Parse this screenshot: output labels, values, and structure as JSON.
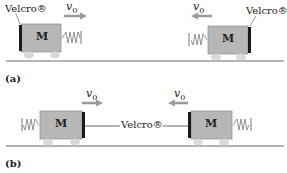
{
  "panel_a": {
    "label": "(a)",
    "left_cart": {
      "mass_label": "M",
      "velcro_label": "Velcro®",
      "velocity_label": "v",
      "velocity_sub": "0",
      "direction": "right"
    },
    "right_cart": {
      "mass_label": "M",
      "velcro_label": "Velcro®",
      "velocity_label": "v",
      "velocity_sub": "0",
      "direction": "left"
    }
  },
  "panel_b": {
    "label": "(b)",
    "left_cart": {
      "mass_label": "M",
      "velocity_label": "v",
      "velocity_sub": "0",
      "direction": "right"
    },
    "right_cart": {
      "mass_label": "M",
      "velocity_label": "v",
      "velocity_sub": "0",
      "direction": "left"
    },
    "connector_label": "Velcro®"
  },
  "colors": {
    "cart_fill": "#b7b7b7",
    "cart_stroke": "#8a8a8a",
    "wheel": "#d9d9d9",
    "velcro": "#1a1a1a",
    "arrow": "#9a9a9a",
    "ground": "#9c9c9c"
  }
}
